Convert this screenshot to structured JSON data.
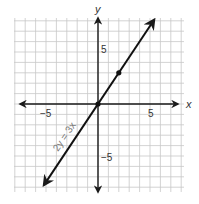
{
  "chart_data": {
    "type": "line",
    "title": "",
    "xlabel": "x",
    "ylabel": "y",
    "xlim": [
      -8,
      8
    ],
    "ylim": [
      -8,
      8
    ],
    "grid": true,
    "x_ticks_labeled": [
      -5,
      5
    ],
    "y_ticks_labeled": [
      5,
      -5
    ],
    "series": [
      {
        "name": "2y = 3x",
        "equation": "2y = 3x",
        "slope": 1.5,
        "intercept": 0,
        "x_range": [
          -5.2,
          5.4
        ],
        "arrows_both_ends": true
      }
    ],
    "points": [
      {
        "x": 0,
        "y": 0
      },
      {
        "x": 2,
        "y": 3
      }
    ],
    "annotations": [
      {
        "text": "2y = 3x",
        "position": "along line, lower-left"
      }
    ]
  },
  "labels": {
    "x_axis": "x",
    "y_axis": "y",
    "x_tick_neg": "−5",
    "x_tick_pos": "5",
    "y_tick_pos": "5",
    "y_tick_neg": "−5",
    "line_label": "2y = 3x"
  },
  "colors": {
    "grid": "#c8c8c8",
    "axis": "#1a1a1a",
    "line": "#111111",
    "text": "#333333",
    "line_label": "#777777"
  }
}
